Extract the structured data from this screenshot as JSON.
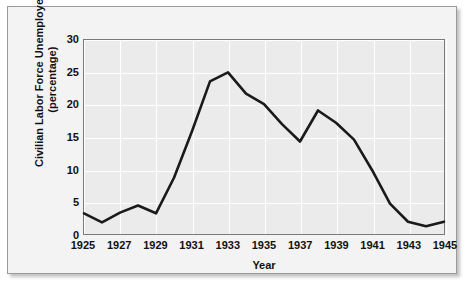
{
  "chart_data": {
    "type": "line",
    "title": "",
    "xlabel": "Year",
    "ylabel": "Civilian Labor Force Unemployed (percentage)",
    "ylabel_line1": "Civilian Labor Force Unemployed",
    "ylabel_line2": "(percentage)",
    "xlim": [
      1925,
      1945
    ],
    "ylim": [
      0,
      30
    ],
    "ytick_labels": [
      "30",
      "25",
      "20",
      "15",
      "10",
      "5",
      "0"
    ],
    "ytick_values": [
      30,
      25,
      20,
      15,
      10,
      5,
      0
    ],
    "xtick_labels": [
      "1925",
      "1927",
      "1929",
      "1931",
      "1933",
      "1935",
      "1937",
      "1939",
      "1941",
      "1943",
      "1945"
    ],
    "xtick_values": [
      1925,
      1927,
      1929,
      1931,
      1933,
      1935,
      1937,
      1939,
      1941,
      1943,
      1945
    ],
    "grid": true,
    "legend": "none",
    "line_color": "#1a1a1a",
    "plot_background": "#ebebeb",
    "gridline_color": "#ffffff",
    "x": [
      1925,
      1926,
      1927,
      1928,
      1929,
      1930,
      1931,
      1932,
      1933,
      1934,
      1935,
      1936,
      1937,
      1938,
      1939,
      1940,
      1941,
      1942,
      1943,
      1944,
      1945
    ],
    "values": [
      3.2,
      1.8,
      3.3,
      4.4,
      3.2,
      8.7,
      15.9,
      23.6,
      25.0,
      21.7,
      20.1,
      17.0,
      14.3,
      19.1,
      17.2,
      14.6,
      9.9,
      4.7,
      1.9,
      1.2,
      1.9
    ],
    "series": [
      {
        "name": "Civilian Labor Force Unemployed",
        "values": [
          3.2,
          1.8,
          3.3,
          4.4,
          3.2,
          8.7,
          15.9,
          23.6,
          25.0,
          21.7,
          20.1,
          17.0,
          14.3,
          19.1,
          17.2,
          14.6,
          9.9,
          4.7,
          1.9,
          1.2,
          1.9
        ]
      }
    ]
  }
}
